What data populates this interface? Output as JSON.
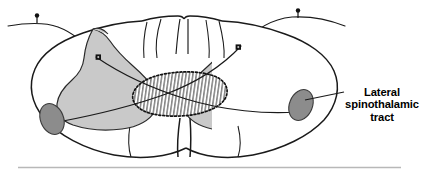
{
  "figure": {
    "kind": "anatomical-diagram",
    "callout": {
      "name": "lateral-spinothalamic-tract",
      "line1": "Lateral",
      "line2": "spinothalamic",
      "line3": "tract"
    },
    "colors": {
      "outline": "#1a1a1a",
      "gray_matter_fill": "#c9c9c9",
      "tract_fill": "#8c8c8c",
      "tract_stroke": "#3a3a3a",
      "hatch_stroke": "#555555",
      "dotted_outline": "#111111",
      "baseline_rule": "#b8b8b8",
      "background": "#ffffff",
      "marker_fill": "#111111"
    },
    "parts": [
      {
        "name": "cord-outline",
        "label": "spinal cord white matter outline"
      },
      {
        "name": "gray-matter-left",
        "label": "left gray matter horn"
      },
      {
        "name": "gray-matter-right",
        "label": "right gray matter horn"
      },
      {
        "name": "central-hatched-region",
        "label": "central hatched commissure region"
      },
      {
        "name": "tract-oval-left",
        "label": "left lateral spinothalamic tract"
      },
      {
        "name": "tract-oval-right",
        "label": "right lateral spinothalamic tract"
      },
      {
        "name": "afferent-fiber-left",
        "label": "left peripheral afferent fiber"
      },
      {
        "name": "afferent-fiber-right",
        "label": "right peripheral afferent fiber"
      },
      {
        "name": "receptor-marker-left",
        "label": "left peripheral receptor"
      },
      {
        "name": "receptor-marker-right",
        "label": "right peripheral receptor"
      },
      {
        "name": "synapse-marker-left",
        "label": "left dorsal horn synapse"
      },
      {
        "name": "synapse-marker-right",
        "label": "right dorsal horn synapse"
      },
      {
        "name": "baseline-rule",
        "label": "horizontal caption rule"
      }
    ]
  }
}
